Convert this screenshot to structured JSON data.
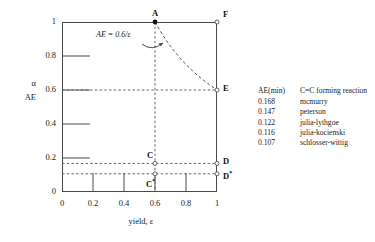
{
  "chart_data": {
    "type": "line",
    "title": "",
    "xlabel": "yield, ε",
    "ylabel_primary": "α",
    "ylabel_secondary": "AE",
    "xlim": [
      0,
      1
    ],
    "ylim": [
      0,
      1
    ],
    "xticks": [
      "0",
      "0.2",
      "0.4",
      "0.6",
      "0.8",
      "1"
    ],
    "xtick_values": [
      0,
      0.2,
      0.4,
      0.6,
      0.8,
      1
    ],
    "yticks": [
      "0",
      "0.2",
      "0.4",
      "0.6",
      "0.8",
      "1"
    ],
    "ytick_values": [
      0,
      0.2,
      0.4,
      0.6,
      0.8,
      1
    ],
    "grid": false,
    "legend_position": "right-outside",
    "curve": {
      "label": "AE = 0.6/ε",
      "equation": "AE = 0.6/ε",
      "style": "dashed",
      "x": [
        0.6,
        0.65,
        0.7,
        0.75,
        0.8,
        0.85,
        0.9,
        0.95,
        1.0
      ],
      "y": [
        1.0,
        0.923,
        0.857,
        0.8,
        0.75,
        0.706,
        0.667,
        0.632,
        0.6
      ]
    },
    "points": [
      {
        "name": "A",
        "label": "A",
        "x": 0.6,
        "y": 1.0,
        "marker": "filled"
      },
      {
        "name": "F",
        "label": "F",
        "x": 1.0,
        "y": 1.0,
        "marker": "open"
      },
      {
        "name": "E",
        "label": "E",
        "x": 1.0,
        "y": 0.6,
        "marker": "open"
      },
      {
        "name": "C",
        "label": "C",
        "x": 0.6,
        "y": 0.168,
        "marker": "open"
      },
      {
        "name": "D",
        "label": "D",
        "x": 1.0,
        "y": 0.168,
        "marker": "open"
      },
      {
        "name": "C*",
        "label": "C",
        "sup": "*",
        "x": 0.6,
        "y": 0.107,
        "marker": "open"
      },
      {
        "name": "D*",
        "label": "D",
        "sup": "*",
        "x": 1.0,
        "y": 0.107,
        "marker": "open"
      }
    ],
    "reference_lines": [
      {
        "name": "horizontal-0.6",
        "orientation": "horizontal",
        "value": 0.6,
        "style": "dashed"
      },
      {
        "name": "horizontal-0.168",
        "orientation": "horizontal",
        "value": 0.168,
        "style": "dashed"
      },
      {
        "name": "horizontal-0.107",
        "orientation": "horizontal",
        "value": 0.107,
        "style": "dashed"
      },
      {
        "name": "vertical-0.6",
        "orientation": "vertical",
        "value": 0.6,
        "style": "dashed"
      }
    ],
    "legend": {
      "headers": [
        "AE(min)",
        "C=C forming reaction"
      ],
      "rows": [
        {
          "ae_min": "0.168",
          "reaction": "mcmurry"
        },
        {
          "ae_min": "0.147",
          "reaction": "peterson"
        },
        {
          "ae_min": "0.122",
          "reaction": "julia-lythgoe"
        },
        {
          "ae_min": "0.116",
          "reaction": "julia-kocienski"
        },
        {
          "ae_min": "0.107",
          "reaction": "schlosser-wittig"
        }
      ]
    },
    "colors": {
      "axis": "#4a4a4a",
      "curve": "#555555",
      "dashed": "#666666",
      "text": "#1a1a1a",
      "background": "#ffffff"
    }
  }
}
